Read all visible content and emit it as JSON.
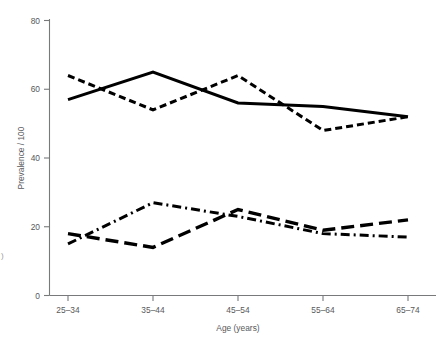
{
  "chart_data": {
    "type": "line",
    "title": "",
    "subtitle": "",
    "xlabel": "Age (years)",
    "ylabel": "Prevalence / 100",
    "categories": [
      "25–34",
      "35–44",
      "45–54",
      "55–64",
      "65–74"
    ],
    "ylim": [
      0,
      80
    ],
    "yticks": [
      0,
      20,
      40,
      60,
      80
    ],
    "ytick_labels": [
      "0",
      "20",
      "40",
      "60",
      "80"
    ],
    "grid": false,
    "legend": "none",
    "series": [
      {
        "name": "series-1-solid",
        "style": "solid",
        "color": "#000000",
        "values": [
          57,
          65,
          56,
          55,
          52
        ]
      },
      {
        "name": "series-2-short-dash",
        "style": "dashed",
        "color": "#000000",
        "values": [
          64,
          54,
          64,
          48,
          52
        ]
      },
      {
        "name": "series-3-dash-dot",
        "style": "dash-dot",
        "color": "#000000",
        "values": [
          15,
          27,
          23,
          18,
          17
        ]
      },
      {
        "name": "series-4-long-dash",
        "style": "long-dash",
        "color": "#000000",
        "values": [
          18,
          14,
          25,
          19,
          22
        ]
      }
    ]
  },
  "axes": {
    "y_axis_title": "Prevalence / 100",
    "x_axis_title": "Age (years)",
    "y_tick_0": "0",
    "y_tick_20": "20",
    "y_tick_40": "40",
    "y_tick_60": "60",
    "y_tick_80": "80",
    "x_tick_0": "25–34",
    "x_tick_1": "35–44",
    "x_tick_2": "45–54",
    "x_tick_3": "55–64",
    "x_tick_4": "65–74"
  },
  "colors": {
    "ink": "#000000",
    "axis": "#77797b",
    "label": "#58595b",
    "background": "#ffffff"
  },
  "margin_artifact": {
    "left_edge_text": ")"
  }
}
